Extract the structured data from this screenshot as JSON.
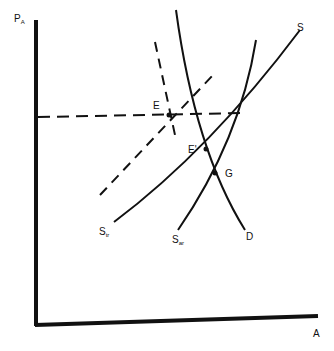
{
  "diagram": {
    "axes": {
      "y_label": "P",
      "y_label_sub": "A",
      "x_label": "A"
    },
    "curves": {
      "supply": {
        "label": "S"
      },
      "supply_tr": {
        "label": "S",
        "sub": "tr"
      },
      "supply_ar": {
        "label": "S",
        "sub": "ar"
      },
      "demand": {
        "label": "D"
      }
    },
    "points": {
      "e": "E",
      "e_prime": "E'",
      "g": "G"
    },
    "colors": {
      "ink": "#111111",
      "background": "#ffffff"
    }
  }
}
